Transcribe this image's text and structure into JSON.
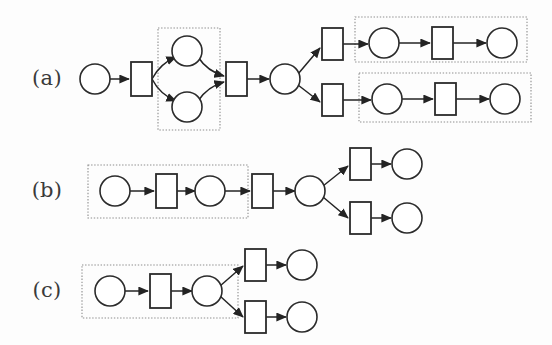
{
  "figure": {
    "background_color": "#fdfdfd",
    "width": 552,
    "height": 345,
    "colors": {
      "node_stroke": "#2b2b2b",
      "node_fill": "#ffffff",
      "arc": "#232323",
      "group_box": "#8d8d8d",
      "label_text": "#3a3a3a"
    },
    "geometry": {
      "place_radius": 15,
      "transition_width": 21,
      "transition_height": 34,
      "transition_height_small": 30
    }
  },
  "rows": [
    {
      "id": "row-a",
      "label": "(a)",
      "label_x": 47,
      "label_y": 79,
      "places": [
        {
          "id": "a-p0",
          "cx": 95,
          "cy": 79,
          "r": 15
        },
        {
          "id": "a-p1",
          "cx": 187,
          "cy": 51,
          "r": 15
        },
        {
          "id": "a-p2",
          "cx": 187,
          "cy": 107,
          "r": 15
        },
        {
          "id": "a-p3",
          "cx": 285,
          "cy": 79,
          "r": 15
        },
        {
          "id": "a-p4",
          "cx": 384,
          "cy": 43,
          "r": 15
        },
        {
          "id": "a-p5",
          "cx": 502,
          "cy": 43,
          "r": 15
        },
        {
          "id": "a-p6",
          "cx": 387,
          "cy": 99,
          "r": 15
        },
        {
          "id": "a-p7",
          "cx": 505,
          "cy": 99,
          "r": 15
        }
      ],
      "transitions": [
        {
          "id": "a-t0",
          "x": 131,
          "y": 62,
          "w": 21,
          "h": 34
        },
        {
          "id": "a-t1",
          "x": 226,
          "y": 62,
          "w": 21,
          "h": 34
        },
        {
          "id": "a-t2",
          "x": 322,
          "y": 28,
          "w": 21,
          "h": 32
        },
        {
          "id": "a-t3",
          "x": 322,
          "y": 84,
          "w": 21,
          "h": 32
        },
        {
          "id": "a-t4",
          "x": 432,
          "y": 27,
          "w": 21,
          "h": 32
        },
        {
          "id": "a-t5",
          "x": 435,
          "y": 83,
          "w": 21,
          "h": 32
        }
      ],
      "arcs": [
        {
          "from": [
            110,
            79
          ],
          "to": [
            129,
            79
          ]
        },
        {
          "from": [
            152,
            79
          ],
          "to": [
            176,
            57
          ],
          "curve": true
        },
        {
          "from": [
            152,
            79
          ],
          "to": [
            176,
            101
          ],
          "curve": true
        },
        {
          "from": [
            198,
            57
          ],
          "to": [
            224,
            76
          ],
          "curve": true
        },
        {
          "from": [
            198,
            101
          ],
          "to": [
            224,
            82
          ],
          "curve": true
        },
        {
          "from": [
            247,
            79
          ],
          "to": [
            269,
            79
          ]
        },
        {
          "from": [
            298,
            74
          ],
          "to": [
            320,
            48
          ]
        },
        {
          "from": [
            298,
            85
          ],
          "to": [
            320,
            102
          ]
        },
        {
          "from": [
            343,
            44
          ],
          "to": [
            368,
            44
          ]
        },
        {
          "from": [
            399,
            43
          ],
          "to": [
            430,
            43
          ]
        },
        {
          "from": [
            453,
            43
          ],
          "to": [
            486,
            43
          ]
        },
        {
          "from": [
            343,
            100
          ],
          "to": [
            371,
            100
          ]
        },
        {
          "from": [
            402,
            99
          ],
          "to": [
            433,
            99
          ]
        },
        {
          "from": [
            456,
            99
          ],
          "to": [
            489,
            99
          ]
        }
      ],
      "group_boxes": [
        {
          "id": "a-box-split",
          "x": 158,
          "y": 28,
          "w": 62,
          "h": 102
        },
        {
          "id": "a-box-upper",
          "x": 355,
          "y": 17,
          "w": 172,
          "h": 45
        },
        {
          "id": "a-box-lower",
          "x": 359,
          "y": 73,
          "w": 172,
          "h": 49
        }
      ]
    },
    {
      "id": "row-b",
      "label": "(b)",
      "label_x": 47,
      "label_y": 191,
      "places": [
        {
          "id": "b-p0",
          "cx": 115,
          "cy": 191,
          "r": 15
        },
        {
          "id": "b-p1",
          "cx": 210,
          "cy": 191,
          "r": 15
        },
        {
          "id": "b-p2",
          "cx": 310,
          "cy": 191,
          "r": 15
        },
        {
          "id": "b-p3",
          "cx": 407,
          "cy": 164,
          "r": 15
        },
        {
          "id": "b-p4",
          "cx": 407,
          "cy": 218,
          "r": 15
        }
      ],
      "transitions": [
        {
          "id": "b-t0",
          "x": 156,
          "y": 174,
          "w": 21,
          "h": 34
        },
        {
          "id": "b-t1",
          "x": 252,
          "y": 174,
          "w": 21,
          "h": 34
        },
        {
          "id": "b-t2",
          "x": 350,
          "y": 148,
          "w": 21,
          "h": 32
        },
        {
          "id": "b-t3",
          "x": 350,
          "y": 202,
          "w": 21,
          "h": 32
        }
      ],
      "arcs": [
        {
          "from": [
            130,
            191
          ],
          "to": [
            154,
            191
          ]
        },
        {
          "from": [
            177,
            191
          ],
          "to": [
            195,
            191
          ]
        },
        {
          "from": [
            225,
            191
          ],
          "to": [
            250,
            191
          ]
        },
        {
          "from": [
            273,
            191
          ],
          "to": [
            295,
            191
          ]
        },
        {
          "from": [
            323,
            186
          ],
          "to": [
            348,
            166
          ]
        },
        {
          "from": [
            323,
            197
          ],
          "to": [
            348,
            218
          ]
        },
        {
          "from": [
            371,
            164
          ],
          "to": [
            391,
            164
          ]
        },
        {
          "from": [
            371,
            218
          ],
          "to": [
            391,
            218
          ]
        }
      ],
      "group_boxes": [
        {
          "id": "b-box-chain",
          "x": 88,
          "y": 165,
          "w": 160,
          "h": 53
        }
      ]
    },
    {
      "id": "row-c",
      "label": "(c)",
      "label_x": 47,
      "label_y": 291,
      "places": [
        {
          "id": "c-p0",
          "cx": 110,
          "cy": 291,
          "r": 15
        },
        {
          "id": "c-p1",
          "cx": 207,
          "cy": 291,
          "r": 15
        },
        {
          "id": "c-p2",
          "cx": 302,
          "cy": 265,
          "r": 15
        },
        {
          "id": "c-p3",
          "cx": 302,
          "cy": 317,
          "r": 15
        }
      ],
      "transitions": [
        {
          "id": "c-t0",
          "x": 150,
          "y": 274,
          "w": 21,
          "h": 34
        },
        {
          "id": "c-t1",
          "x": 245,
          "y": 249,
          "w": 21,
          "h": 32
        },
        {
          "id": "c-t2",
          "x": 245,
          "y": 301,
          "w": 21,
          "h": 32
        }
      ],
      "arcs": [
        {
          "from": [
            125,
            291
          ],
          "to": [
            148,
            291
          ]
        },
        {
          "from": [
            171,
            291
          ],
          "to": [
            192,
            291
          ]
        },
        {
          "from": [
            220,
            286
          ],
          "to": [
            243,
            266
          ]
        },
        {
          "from": [
            220,
            296
          ],
          "to": [
            243,
            317
          ]
        },
        {
          "from": [
            266,
            265
          ],
          "to": [
            286,
            265
          ]
        },
        {
          "from": [
            266,
            317
          ],
          "to": [
            286,
            317
          ]
        }
      ],
      "group_boxes": [
        {
          "id": "c-box-chain",
          "x": 82,
          "y": 265,
          "w": 156,
          "h": 53
        }
      ]
    }
  ]
}
